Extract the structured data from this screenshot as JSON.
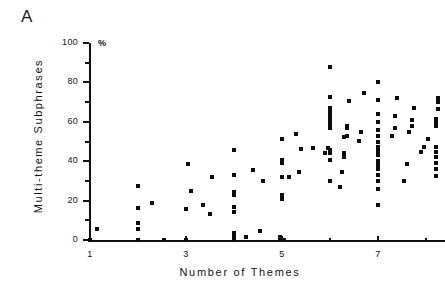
{
  "panel": {
    "label": "A"
  },
  "axis_unit": "%",
  "chart_data": {
    "type": "scatter",
    "title": "",
    "subtitle": "",
    "xlabel": "Number of Themes",
    "ylabel": "Multi-theme Subphrases",
    "y_unit_annotation": "%",
    "xlim": [
      1,
      8.35
    ],
    "ylim": [
      0,
      100
    ],
    "grid": false,
    "legend": null,
    "x_ticks_major": [
      1,
      2,
      3,
      4,
      5,
      6,
      7,
      8
    ],
    "x_tick_labels": [
      "1",
      "",
      "3",
      "",
      "5",
      "",
      "7",
      ""
    ],
    "y_ticks_major": [
      0,
      20,
      40,
      60,
      80,
      100
    ],
    "y_ticks_minor": [
      10,
      30,
      50,
      70,
      90
    ],
    "y_tick_labels": [
      "0",
      "20",
      "40",
      "60",
      "80",
      "100"
    ],
    "marker": "square",
    "marker_color": "#0d0d0d",
    "points": [
      [
        1.0,
        0
      ],
      [
        1.15,
        5.5
      ],
      [
        2.0,
        0
      ],
      [
        2.0,
        5.5
      ],
      [
        2.0,
        8.5
      ],
      [
        2.0,
        16
      ],
      [
        2.0,
        27.5
      ],
      [
        2.3,
        19
      ],
      [
        2.55,
        0
      ],
      [
        3.0,
        0
      ],
      [
        3.0,
        15.5
      ],
      [
        3.05,
        38.5
      ],
      [
        3.1,
        25
      ],
      [
        3.35,
        18
      ],
      [
        3.5,
        13
      ],
      [
        3.55,
        32
      ],
      [
        4.0,
        0
      ],
      [
        4.0,
        1.5
      ],
      [
        4.0,
        3.5
      ],
      [
        4.0,
        14
      ],
      [
        4.0,
        17
      ],
      [
        4.0,
        23
      ],
      [
        4.0,
        24.5
      ],
      [
        4.0,
        33
      ],
      [
        4.0,
        45.5
      ],
      [
        4.25,
        1.5
      ],
      [
        4.4,
        35.5
      ],
      [
        4.55,
        4.5
      ],
      [
        4.6,
        30
      ],
      [
        4.95,
        0
      ],
      [
        4.95,
        1.5
      ],
      [
        5.0,
        21
      ],
      [
        5.0,
        23
      ],
      [
        5.0,
        32
      ],
      [
        5.0,
        39
      ],
      [
        5.0,
        40.5
      ],
      [
        5.0,
        51.5
      ],
      [
        5.05,
        0
      ],
      [
        5.15,
        32
      ],
      [
        5.3,
        54
      ],
      [
        5.35,
        34.5
      ],
      [
        5.4,
        46
      ],
      [
        5.65,
        46.5
      ],
      [
        5.9,
        44
      ],
      [
        5.95,
        46.5
      ],
      [
        6.0,
        30
      ],
      [
        6.0,
        40.5
      ],
      [
        6.0,
        44
      ],
      [
        6.0,
        45
      ],
      [
        6.0,
        45.5
      ],
      [
        6.0,
        57
      ],
      [
        6.0,
        59
      ],
      [
        6.0,
        61
      ],
      [
        6.0,
        63
      ],
      [
        6.0,
        65
      ],
      [
        6.0,
        67
      ],
      [
        6.0,
        72.5
      ],
      [
        6.0,
        88
      ],
      [
        6.2,
        27
      ],
      [
        6.25,
        34.5
      ],
      [
        6.3,
        42
      ],
      [
        6.3,
        44
      ],
      [
        6.3,
        52.5
      ],
      [
        6.35,
        53
      ],
      [
        6.35,
        57
      ],
      [
        6.35,
        58
      ],
      [
        6.4,
        70.5
      ],
      [
        6.6,
        50.5
      ],
      [
        6.65,
        55
      ],
      [
        6.7,
        74.5
      ],
      [
        7.0,
        18
      ],
      [
        7.0,
        26
      ],
      [
        7.0,
        30
      ],
      [
        7.0,
        33
      ],
      [
        7.0,
        36
      ],
      [
        7.0,
        38
      ],
      [
        7.0,
        40
      ],
      [
        7.0,
        43
      ],
      [
        7.0,
        45
      ],
      [
        7.0,
        47
      ],
      [
        7.0,
        50
      ],
      [
        7.0,
        53
      ],
      [
        7.0,
        56
      ],
      [
        7.0,
        60
      ],
      [
        7.0,
        64
      ],
      [
        7.0,
        71
      ],
      [
        7.0,
        80
      ],
      [
        7.3,
        53
      ],
      [
        7.35,
        57
      ],
      [
        7.35,
        63
      ],
      [
        7.4,
        72
      ],
      [
        7.55,
        30
      ],
      [
        7.6,
        38.5
      ],
      [
        7.65,
        55
      ],
      [
        7.7,
        58
      ],
      [
        7.7,
        61
      ],
      [
        7.75,
        67
      ],
      [
        7.9,
        44.5
      ],
      [
        7.95,
        47
      ],
      [
        8.05,
        51.5
      ],
      [
        8.2,
        32.5
      ],
      [
        8.2,
        36
      ],
      [
        8.2,
        39
      ],
      [
        8.2,
        42
      ],
      [
        8.2,
        44.5
      ],
      [
        8.2,
        47
      ],
      [
        8.2,
        58
      ],
      [
        8.2,
        60
      ],
      [
        8.2,
        61.5
      ],
      [
        8.25,
        66.5
      ],
      [
        8.25,
        70
      ],
      [
        8.25,
        72
      ]
    ]
  }
}
